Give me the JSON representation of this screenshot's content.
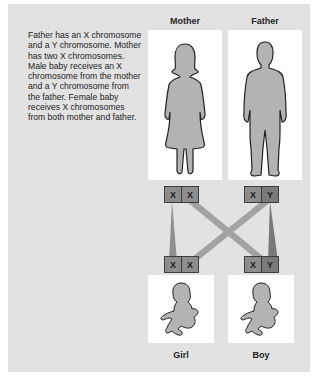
{
  "caption": "Father has an X chromosome and a Y chromosome. Mother has two X chromosomes. Male baby receives an X chromosome from the mother and a Y chromosome from the father. Female baby receives X chromosomes from both mother and father.",
  "parents": {
    "mother": {
      "label": "Mother",
      "chromosomes": [
        "X",
        "X"
      ]
    },
    "father": {
      "label": "Father",
      "chromosomes": [
        "X",
        "Y"
      ]
    }
  },
  "children": {
    "girl": {
      "label": "Girl",
      "chromosomes": [
        "X",
        "X"
      ]
    },
    "boy": {
      "label": "Boy",
      "chromosomes": [
        "X",
        "Y"
      ]
    }
  },
  "colors": {
    "panel": "#e2e2e2",
    "card": "#ffffff",
    "figure_fill": "#b3b3b3",
    "chromosome_x": "#8d8d8d",
    "chromosome_y": "#7a7a7a",
    "connector": "#9a9a9a"
  }
}
